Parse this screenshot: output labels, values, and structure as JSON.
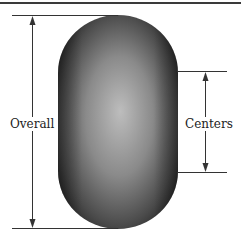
{
  "diagram": {
    "labels": {
      "overall": "Overall",
      "centers": "Centers"
    },
    "colors": {
      "capsule_edge": "#1e1e1e",
      "capsule_center": "#bcbcbc",
      "line": "#333333",
      "top_rule": "#3a3a3a"
    }
  }
}
